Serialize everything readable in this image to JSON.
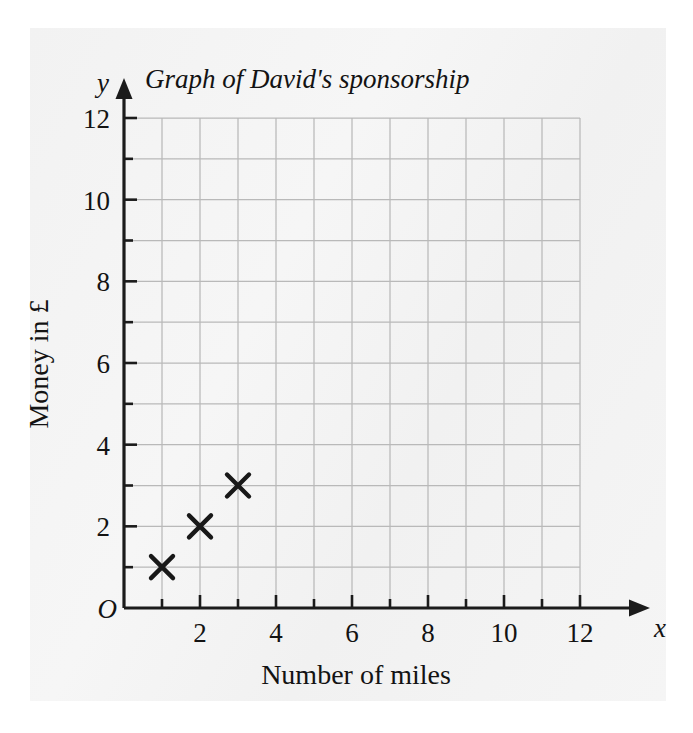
{
  "chart_data": {
    "type": "scatter",
    "title": "Graph of David's sponsorship",
    "xlabel": "Number of miles",
    "ylabel": "Money in £",
    "x_axis_symbol": "x",
    "y_axis_symbol": "y",
    "origin_label": "O",
    "xlim": [
      0,
      12
    ],
    "ylim": [
      0,
      12
    ],
    "x_tick_interval": 1,
    "y_tick_interval": 1,
    "x_labeled_ticks": [
      2,
      4,
      6,
      8,
      10,
      12
    ],
    "y_labeled_ticks": [
      2,
      4,
      6,
      8,
      10,
      12
    ],
    "x_tick_labels": [
      "2",
      "4",
      "6",
      "8",
      "10",
      "12"
    ],
    "y_tick_labels": [
      "2",
      "4",
      "6",
      "8",
      "10",
      "12"
    ],
    "grid": true,
    "legend": null,
    "x": [
      1,
      2,
      3
    ],
    "y": [
      1,
      2,
      3
    ],
    "points": [
      {
        "x": 1,
        "y": 1,
        "marker": "cross"
      },
      {
        "x": 2,
        "y": 2,
        "marker": "cross"
      },
      {
        "x": 3,
        "y": 3,
        "marker": "cross"
      }
    ],
    "marker_style": "cross",
    "colors": {
      "marker": "#181818",
      "axis": "#1b1b1b",
      "grid": "#b9b9b9",
      "page": "#f4f4f4",
      "text": "#131313"
    }
  }
}
